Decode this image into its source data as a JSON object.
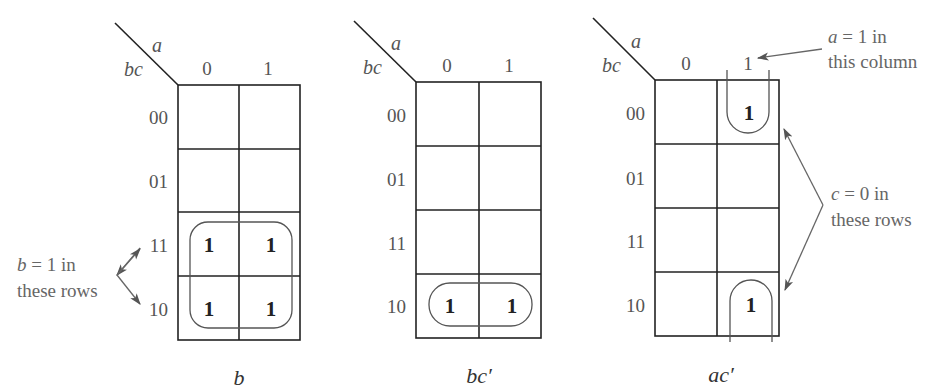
{
  "maps": [
    {
      "id": "map-b",
      "corner": {
        "col_var": "a",
        "row_var": "bc"
      },
      "col_headers": [
        "0",
        "1"
      ],
      "row_headers": [
        "00",
        "01",
        "11",
        "10"
      ],
      "cells": [
        [
          "",
          ""
        ],
        [
          "",
          ""
        ],
        [
          "1",
          "1"
        ],
        [
          "1",
          "1"
        ]
      ],
      "caption": "b",
      "annotation": {
        "line1_var": "b",
        "line1_rest": " = 1  in",
        "line2": "these rows"
      }
    },
    {
      "id": "map-bc-prime",
      "corner": {
        "col_var": "a",
        "row_var": "bc"
      },
      "col_headers": [
        "0",
        "1"
      ],
      "row_headers": [
        "00",
        "01",
        "11",
        "10"
      ],
      "cells": [
        [
          "",
          ""
        ],
        [
          "",
          ""
        ],
        [
          "",
          ""
        ],
        [
          "1",
          "1"
        ]
      ],
      "caption": "bc′"
    },
    {
      "id": "map-ac-prime",
      "corner": {
        "col_var": "a",
        "row_var": "bc"
      },
      "col_headers": [
        "0",
        "1"
      ],
      "row_headers": [
        "00",
        "01",
        "11",
        "10"
      ],
      "cells": [
        [
          "",
          "1"
        ],
        [
          "",
          ""
        ],
        [
          "",
          ""
        ],
        [
          "",
          "1"
        ]
      ],
      "caption": "ac′",
      "annotation_top": {
        "line1_var": "a",
        "line1_rest": " = 1  in",
        "line2": "this column"
      },
      "annotation_right": {
        "line1_var": "c",
        "line1_rest": " = 0  in",
        "line2": "these rows"
      }
    }
  ]
}
